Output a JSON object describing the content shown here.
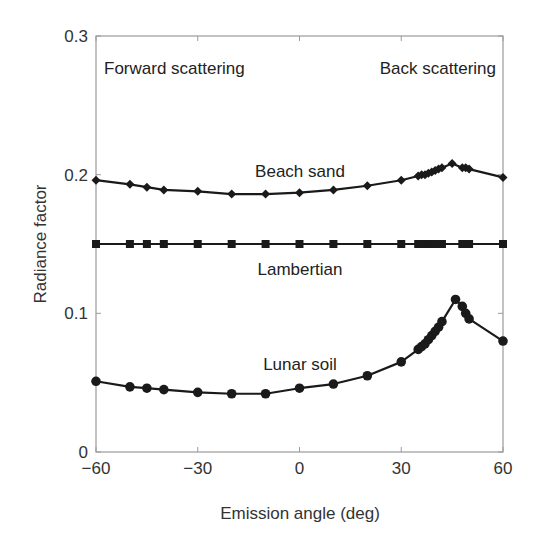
{
  "chart_data": {
    "type": "line",
    "title": "",
    "xlabel": "Emission angle (deg)",
    "ylabel": "Radiance factor",
    "xlim": [
      -60,
      60
    ],
    "ylim": [
      0,
      0.3
    ],
    "xticks": [
      -60,
      -30,
      0,
      30,
      60
    ],
    "xtick_labels": [
      "−60",
      "−30",
      "0",
      "30",
      "60"
    ],
    "yticks": [
      0,
      0.1,
      0.2,
      0.3
    ],
    "ytick_labels": [
      "0",
      "0.1",
      "0.2",
      "0.3"
    ],
    "grid": false,
    "legend": "none (inline curve labels)",
    "annotations": [
      {
        "text": "Forward scattering",
        "x": -45,
        "y": 0.273
      },
      {
        "text": "Back scattering",
        "x": 46,
        "y": 0.273
      },
      {
        "text": "Beach sand",
        "x": 0,
        "y": 0.205
      },
      {
        "text": "Lambertian",
        "x": 0,
        "y": 0.131
      },
      {
        "text": "Lunar soil",
        "x": 0,
        "y": 0.063
      }
    ],
    "series": [
      {
        "name": "Beach sand",
        "marker": "diamond",
        "x": [
          -60,
          -50,
          -45,
          -40,
          -30,
          -20,
          -10,
          0,
          10,
          20,
          30,
          35,
          36,
          37,
          38,
          39,
          40,
          41,
          42,
          45,
          48,
          49,
          50,
          60
        ],
        "y": [
          0.196,
          0.193,
          0.191,
          0.189,
          0.188,
          0.186,
          0.186,
          0.187,
          0.189,
          0.192,
          0.196,
          0.199,
          0.2,
          0.2,
          0.201,
          0.202,
          0.203,
          0.204,
          0.205,
          0.208,
          0.205,
          0.205,
          0.204,
          0.198
        ]
      },
      {
        "name": "Lambertian",
        "marker": "square",
        "x": [
          -60,
          -50,
          -45,
          -40,
          -30,
          -20,
          -10,
          0,
          10,
          20,
          30,
          35,
          36,
          37,
          38,
          39,
          40,
          41,
          42,
          48,
          49,
          50,
          60
        ],
        "y": [
          0.15,
          0.15,
          0.15,
          0.15,
          0.15,
          0.15,
          0.15,
          0.15,
          0.15,
          0.15,
          0.15,
          0.15,
          0.15,
          0.15,
          0.15,
          0.15,
          0.15,
          0.15,
          0.15,
          0.15,
          0.15,
          0.15,
          0.15
        ]
      },
      {
        "name": "Lunar soil",
        "marker": "circle",
        "x": [
          -60,
          -50,
          -45,
          -40,
          -30,
          -20,
          -10,
          0,
          10,
          20,
          30,
          35,
          36,
          37,
          38,
          39,
          40,
          41,
          42,
          46,
          48,
          49,
          50,
          60
        ],
        "y": [
          0.051,
          0.047,
          0.046,
          0.045,
          0.043,
          0.042,
          0.042,
          0.046,
          0.049,
          0.055,
          0.065,
          0.074,
          0.076,
          0.078,
          0.081,
          0.084,
          0.087,
          0.09,
          0.094,
          0.11,
          0.105,
          0.1,
          0.096,
          0.08
        ]
      }
    ]
  },
  "colors": {
    "line": "#1a1a1a",
    "axis": "#9a9a9a",
    "text": "#333333",
    "background": "#ffffff"
  }
}
